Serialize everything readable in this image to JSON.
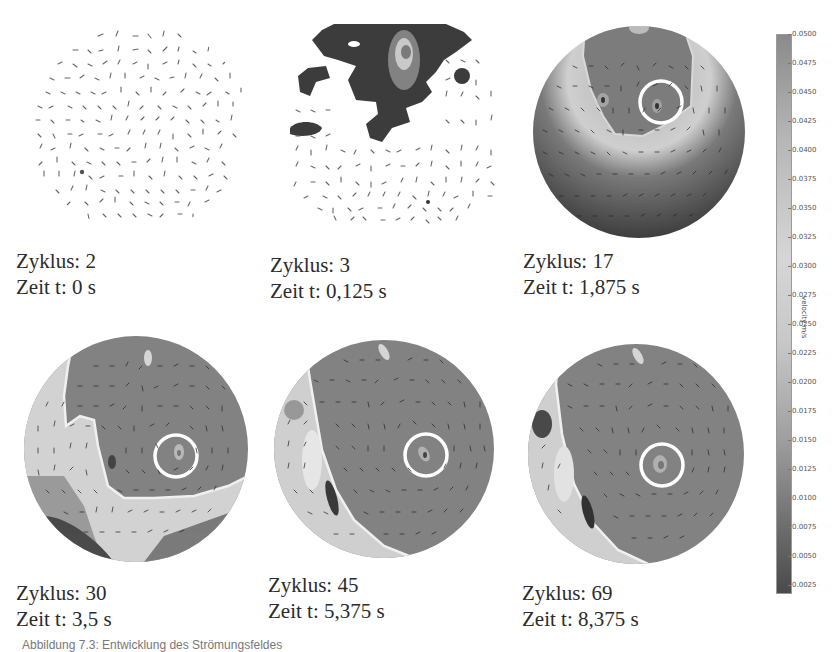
{
  "figure": {
    "panels": [
      {
        "cycle_label": "Zyklus: 2",
        "time_label": "Zeit t: 0 s",
        "cycle": 2,
        "time_s": "0"
      },
      {
        "cycle_label": "Zyklus: 3",
        "time_label": "Zeit t: 0,125 s",
        "cycle": 3,
        "time_s": "0,125"
      },
      {
        "cycle_label": "Zyklus: 17",
        "time_label": "Zeit t: 1,875 s",
        "cycle": 17,
        "time_s": "1,875"
      },
      {
        "cycle_label": "Zyklus: 30",
        "time_label": "Zeit t: 3,5 s",
        "cycle": 30,
        "time_s": "3,5"
      },
      {
        "cycle_label": "Zyklus: 45",
        "time_label": "Zeit t: 5,375 s",
        "cycle": 45,
        "time_s": "5,375"
      },
      {
        "cycle_label": "Zyklus: 69",
        "time_label": "Zeit t: 8,375 s",
        "cycle": 69,
        "time_s": "8,375"
      }
    ],
    "colorbar": {
      "label": "velocity m/s",
      "ticks": [
        "0.0500",
        "0.0475",
        "0.0450",
        "0.0425",
        "0.0400",
        "0.0375",
        "0.0350",
        "0.0325",
        "0.0300",
        "0.0275",
        "0.0250",
        "0.0225",
        "0.0200",
        "0.0175",
        "0.0150",
        "0.0125",
        "0.0100",
        "0.0075",
        "0.0050",
        "0.0025"
      ]
    },
    "footer_caption": "Abbildung 7.3: Entwicklung des Strömungsfeldes"
  }
}
